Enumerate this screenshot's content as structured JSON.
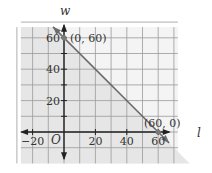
{
  "chart_data": {
    "type": "line",
    "title": "",
    "xlabel": "l",
    "ylabel": "w",
    "origin_label": "O",
    "xlim": [
      -30,
      70
    ],
    "ylim": [
      -20,
      70
    ],
    "grid": true,
    "grid_step": 10,
    "x_ticks": [
      -20,
      20,
      40,
      60
    ],
    "x_tick_labels": [
      "−20",
      "20",
      "40",
      "60"
    ],
    "y_ticks": [
      20,
      40,
      60
    ],
    "y_tick_labels": [
      "20",
      "40",
      "60"
    ],
    "shaded_region": "below line l + w = 60",
    "series": [
      {
        "name": "l + w = 60",
        "x": [
          -7,
          67
        ],
        "y": [
          67,
          -7
        ],
        "color": "#6b6b6b"
      }
    ],
    "points": [
      {
        "label": "(0, 60)",
        "x": 0,
        "y": 60
      },
      {
        "label": "(60, 0)",
        "x": 60,
        "y": 0
      }
    ],
    "colors": {
      "shade": "#e6e6e6",
      "grid": "#9a9a9a",
      "axis": "#222222",
      "line": "#6b6b6b"
    }
  }
}
